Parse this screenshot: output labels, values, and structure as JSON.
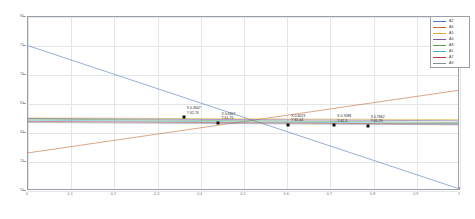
{
  "chart_data": {
    "type": "line",
    "title": "",
    "xlabel": "",
    "ylabel": "",
    "xlim": [
      0,
      1
    ],
    "ylim": [
      50,
      80
    ],
    "grid": true,
    "legend_position": "top-right",
    "xticks": [
      "0",
      "0.1",
      "0.2",
      "0.3",
      "0.4",
      "0.5",
      "0.6",
      "0.7",
      "0.8",
      "0.9",
      "1"
    ],
    "xtick_values": [
      0,
      0.1,
      0.2,
      0.3,
      0.4,
      0.5,
      0.6,
      0.7,
      0.8,
      0.9,
      1
    ],
    "yticks": [
      "50",
      "55",
      "60",
      "65",
      "70",
      "75",
      "80"
    ],
    "ytick_values": [
      50,
      55,
      60,
      65,
      70,
      75,
      80
    ],
    "legend": [
      {
        "name": "A2",
        "color": "#4a78b8"
      },
      {
        "name": "A6",
        "color": "#c06a3a"
      },
      {
        "name": "A5",
        "color": "#d9b23a"
      },
      {
        "name": "A4",
        "color": "#7a5ba8"
      },
      {
        "name": "A8",
        "color": "#5aa050"
      },
      {
        "name": "A1",
        "color": "#46b0d0"
      },
      {
        "name": "A7",
        "color": "#b03a48"
      },
      {
        "name": "A3",
        "color": "#8a8f94"
      }
    ],
    "series": [
      {
        "name": "A2",
        "color": "#4a78b8",
        "x": [
          0,
          1
        ],
        "y": [
          75.0,
          50.1
        ]
      },
      {
        "name": "A6",
        "color": "#c06a3a",
        "x": [
          0,
          1
        ],
        "y": [
          56.3,
          67.2
        ]
      },
      {
        "name": "A5",
        "color": "#d9b23a",
        "x": [
          0,
          1
        ],
        "y": [
          62.4,
          62.1
        ]
      },
      {
        "name": "A4",
        "color": "#7a5ba8",
        "x": [
          0,
          1
        ],
        "y": [
          62.3,
          61.9
        ]
      },
      {
        "name": "A8",
        "color": "#5aa050",
        "x": [
          0,
          1
        ],
        "y": [
          62.2,
          61.6
        ]
      },
      {
        "name": "A1",
        "color": "#46b0d0",
        "x": [
          0,
          1
        ],
        "y": [
          62.0,
          61.4
        ]
      },
      {
        "name": "A7",
        "color": "#b03a48",
        "x": [
          0,
          1
        ],
        "y": [
          61.8,
          61.3
        ]
      },
      {
        "name": "A3",
        "color": "#8a8f94",
        "x": [
          0,
          1
        ],
        "y": [
          61.6,
          61.2
        ]
      }
    ],
    "annotations": [
      {
        "x": 0.3607,
        "y": 62.74,
        "x_label": "X 0.3607",
        "y_label": "Y 62.74"
      },
      {
        "x": 0.4407,
        "y": 61.75,
        "x_label": "X 0.4407",
        "y_label": "Y 61.75"
      },
      {
        "x": 0.6023,
        "y": 61.44,
        "x_label": "X 0.6023",
        "y_label": "Y 61.44"
      },
      {
        "x": 0.7088,
        "y": 61.3,
        "x_label": "X 0.7088",
        "y_label": "Y 61.3"
      },
      {
        "x": 0.7862,
        "y": 61.29,
        "x_label": "X 0.7862",
        "y_label": "Y 61.29"
      }
    ]
  }
}
